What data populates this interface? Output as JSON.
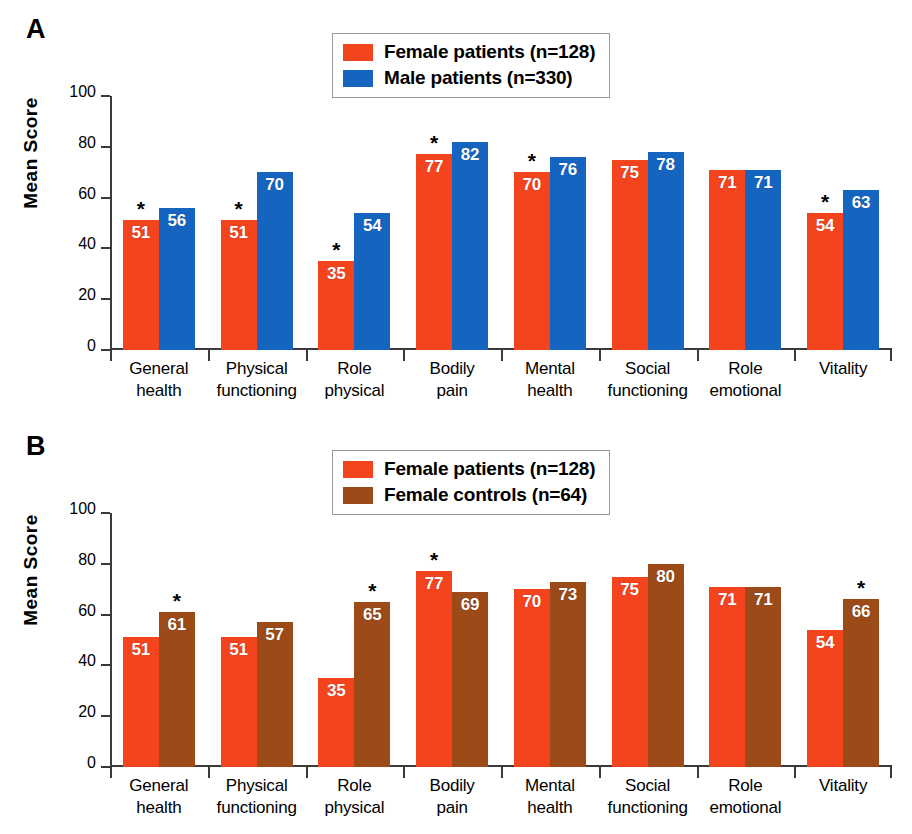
{
  "figure": {
    "panels": [
      {
        "letter": "A",
        "ylabel": "Mean Score",
        "legend": [
          {
            "label": "Female patients (n=128)",
            "color": "#F4441E",
            "key": "female_patients"
          },
          {
            "label": "Male patients (n=330)",
            "color": "#1464C0",
            "key": "male_patients"
          }
        ]
      },
      {
        "letter": "B",
        "ylabel": "Mean Score",
        "legend": [
          {
            "label": "Female patients (n=128)",
            "color": "#F4441E",
            "key": "female_patients"
          },
          {
            "label": "Female controls (n=64)",
            "color": "#9B4A18",
            "key": "female_controls"
          }
        ]
      }
    ]
  },
  "colors": {
    "female_patients": "#F4441E",
    "male_patients": "#1464C0",
    "female_controls": "#9B4A18",
    "axis": "#3a3a3a",
    "legend_border": "#9a9a9a",
    "value_text": "#FFFFFF",
    "star": "#000000"
  },
  "yticks": [
    "0",
    "20",
    "40",
    "60",
    "80",
    "100"
  ],
  "ytick_values": [
    0,
    20,
    40,
    60,
    80,
    100
  ],
  "categories": [
    "General\nhealth",
    "Physical\nfunctioning",
    "Role\nphysical",
    "Bodily\npain",
    "Mental\nhealth",
    "Social\nfunctioning",
    "Role\nemotional",
    "Vitality"
  ],
  "chart_data": [
    {
      "type": "bar",
      "title": "A",
      "xlabel": "",
      "ylabel": "Mean Score",
      "ylim": [
        0,
        100
      ],
      "grid": false,
      "legend_position": "top-center",
      "categories": [
        "General health",
        "Physical functioning",
        "Role physical",
        "Bodily pain",
        "Mental health",
        "Social functioning",
        "Role emotional",
        "Vitality"
      ],
      "series": [
        {
          "name": "Female patients (n=128)",
          "color": "#F4441E",
          "values": [
            51,
            51,
            35,
            77,
            70,
            75,
            71,
            54
          ],
          "labels": [
            "51",
            "51",
            "35",
            "77",
            "70",
            "75",
            "71",
            "54"
          ],
          "significance": [
            true,
            true,
            true,
            true,
            true,
            false,
            false,
            true
          ]
        },
        {
          "name": "Male patients (n=330)",
          "color": "#1464C0",
          "values": [
            56,
            70,
            54,
            82,
            76,
            78,
            71,
            63
          ],
          "labels": [
            "56",
            "70",
            "54",
            "82",
            "76",
            "78",
            "71",
            "63"
          ],
          "significance": [
            false,
            false,
            false,
            false,
            false,
            false,
            false,
            false
          ]
        }
      ],
      "annotations": {
        "asterisk": "*",
        "meaning": "Asterisk marks statistically significant difference between groups"
      }
    },
    {
      "type": "bar",
      "title": "B",
      "xlabel": "",
      "ylabel": "Mean Score",
      "ylim": [
        0,
        100
      ],
      "grid": false,
      "legend_position": "top-center",
      "categories": [
        "General health",
        "Physical functioning",
        "Role physical",
        "Bodily pain",
        "Mental health",
        "Social functioning",
        "Role emotional",
        "Vitality"
      ],
      "series": [
        {
          "name": "Female patients (n=128)",
          "color": "#F4441E",
          "values": [
            51,
            51,
            35,
            77,
            70,
            75,
            71,
            54
          ],
          "labels": [
            "51",
            "51",
            "35",
            "77",
            "70",
            "75",
            "71",
            "54"
          ],
          "significance": [
            false,
            false,
            false,
            true,
            false,
            false,
            false,
            false
          ]
        },
        {
          "name": "Female controls (n=64)",
          "color": "#9B4A18",
          "values": [
            61,
            57,
            65,
            69,
            73,
            80,
            71,
            66
          ],
          "labels": [
            "61",
            "57",
            "65",
            "69",
            "73",
            "80",
            "71",
            "66"
          ],
          "significance": [
            true,
            false,
            true,
            false,
            false,
            false,
            false,
            true
          ]
        }
      ],
      "annotations": {
        "asterisk": "*",
        "meaning": "Asterisk marks statistically significant difference between groups"
      }
    }
  ]
}
